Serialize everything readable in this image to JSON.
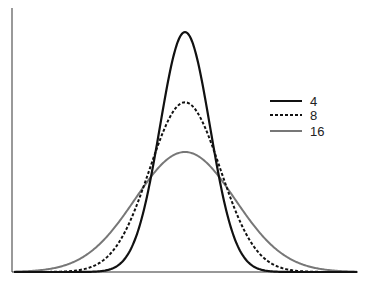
{
  "chart_data": {
    "type": "line",
    "title": "",
    "xlabel": "",
    "ylabel": "",
    "grid": false,
    "legend_position": "right-upper",
    "ticks": "none",
    "series": [
      {
        "name": "4",
        "style": "solid",
        "color": "#111111",
        "relative_sigma": 1.0,
        "relative_peak": 1.0
      },
      {
        "name": "8",
        "style": "dashed",
        "color": "#111111",
        "relative_sigma": 1.414,
        "relative_peak": 0.707
      },
      {
        "name": "16",
        "style": "solid",
        "color": "#777777",
        "relative_sigma": 2.0,
        "relative_peak": 0.5
      }
    ]
  },
  "legend": {
    "items": [
      {
        "label": "4"
      },
      {
        "label": "8"
      },
      {
        "label": "16"
      }
    ]
  }
}
